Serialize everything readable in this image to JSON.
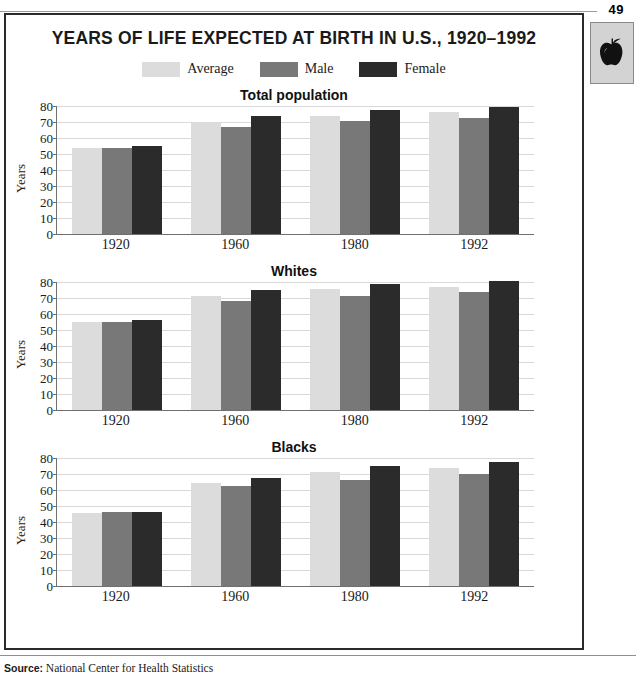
{
  "page": {
    "number": "49",
    "badge_icon": "apple-icon"
  },
  "panel": {
    "title": "YEARS OF LIFE EXPECTED AT BIRTH IN U.S., 1920–1992"
  },
  "legend": {
    "items": [
      {
        "label": "Average",
        "color": "#dcdcdc"
      },
      {
        "label": "Male",
        "color": "#787878"
      },
      {
        "label": "Female",
        "color": "#2b2b2b"
      }
    ]
  },
  "footer": {
    "source_label": "Source:",
    "source_text": "National Center for Health Statistics"
  },
  "axis": {
    "y_title": "Years",
    "ticks": [
      "80",
      "70",
      "60",
      "50",
      "40",
      "30",
      "20",
      "10",
      "0"
    ]
  },
  "chart_data": [
    {
      "type": "bar",
      "title": "Total population",
      "xlabel": "",
      "ylabel": "Years",
      "ylim": [
        0,
        80
      ],
      "grid": true,
      "legend_position": "top-center",
      "categories": [
        "1920",
        "1960",
        "1980",
        "1992"
      ],
      "series": [
        {
          "name": "Average",
          "color": "#dcdcdc",
          "values": [
            54,
            70,
            74,
            76
          ]
        },
        {
          "name": "Male",
          "color": "#787878",
          "values": [
            54,
            67,
            70.5,
            72.5
          ]
        },
        {
          "name": "Female",
          "color": "#2b2b2b",
          "values": [
            55,
            73.5,
            77.5,
            79.5
          ]
        }
      ]
    },
    {
      "type": "bar",
      "title": "Whites",
      "xlabel": "",
      "ylabel": "Years",
      "ylim": [
        0,
        80
      ],
      "grid": true,
      "legend_position": "top-center",
      "categories": [
        "1920",
        "1960",
        "1980",
        "1992"
      ],
      "series": [
        {
          "name": "Average",
          "color": "#dcdcdc",
          "values": [
            55,
            71,
            75.5,
            77
          ]
        },
        {
          "name": "Male",
          "color": "#787878",
          "values": [
            55,
            68,
            71.5,
            74
          ]
        },
        {
          "name": "Female",
          "color": "#2b2b2b",
          "values": [
            56,
            75,
            79,
            80.5
          ]
        }
      ]
    },
    {
      "type": "bar",
      "title": "Blacks",
      "xlabel": "",
      "ylabel": "Years",
      "ylim": [
        0,
        80
      ],
      "grid": true,
      "legend_position": "top-center",
      "categories": [
        "1920",
        "1960",
        "1980",
        "1992"
      ],
      "series": [
        {
          "name": "Average",
          "color": "#dcdcdc",
          "values": [
            45.5,
            64.5,
            71,
            73.5
          ]
        },
        {
          "name": "Male",
          "color": "#787878",
          "values": [
            46,
            62.5,
            66.5,
            70
          ]
        },
        {
          "name": "Female",
          "color": "#2b2b2b",
          "values": [
            46,
            67.5,
            75,
            77.5
          ]
        }
      ]
    }
  ]
}
